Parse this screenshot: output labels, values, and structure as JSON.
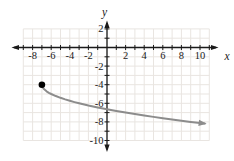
{
  "figure": {
    "background": "#ffffff",
    "axis_color": "#1a1a1a",
    "grid_color": "#e9e5e1",
    "curve_color": "#8c8c8c",
    "dot_color": "#000000",
    "x_axis_label": "x",
    "y_axis_label": "y"
  },
  "chart_data": {
    "type": "line",
    "title": "",
    "xlabel": "x",
    "ylabel": "y",
    "xlim": [
      -9,
      11
    ],
    "ylim": [
      -10,
      2
    ],
    "grid": true,
    "tick_step": 1,
    "x_labeled_ticks": [
      -8,
      -6,
      -4,
      -2,
      2,
      4,
      6,
      8,
      10
    ],
    "y_labeled_ticks": [
      2,
      -2,
      -4,
      -6,
      -8,
      -10
    ],
    "series": [
      {
        "name": "square-root-curve",
        "description": "Curve begins at closed dot (-7,-4), decreases and flattens, ends with arrowhead near (10.5,-8.2); matches y = -sqrt(x+7) - 4",
        "start_dot": [
          -7,
          -4
        ],
        "arrow_end": true,
        "points": [
          [
            -7,
            -4
          ],
          [
            -6.9,
            -4.32
          ],
          [
            -6.75,
            -4.5
          ],
          [
            -6.5,
            -4.71
          ],
          [
            -6.25,
            -4.87
          ],
          [
            -6,
            -5
          ],
          [
            -5.5,
            -5.22
          ],
          [
            -5,
            -5.41
          ],
          [
            -4.5,
            -5.58
          ],
          [
            -4,
            -5.73
          ],
          [
            -3.5,
            -5.87
          ],
          [
            -3,
            -6
          ],
          [
            -2,
            -6.24
          ],
          [
            -1,
            -6.45
          ],
          [
            0,
            -6.65
          ],
          [
            1,
            -6.83
          ],
          [
            2,
            -7
          ],
          [
            3,
            -7.16
          ],
          [
            4,
            -7.32
          ],
          [
            5,
            -7.46
          ],
          [
            6,
            -7.61
          ],
          [
            7,
            -7.74
          ],
          [
            8,
            -7.87
          ],
          [
            9,
            -8
          ],
          [
            10,
            -8.12
          ],
          [
            10.5,
            -8.18
          ]
        ]
      }
    ]
  }
}
